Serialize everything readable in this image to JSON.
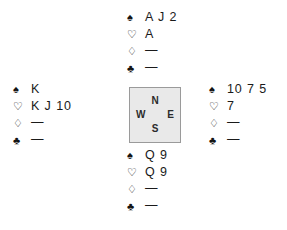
{
  "diagram": {
    "type": "bridge-hand-diagram",
    "suit_symbols": {
      "spade": "♠",
      "heart": "♡",
      "diamond": "♢",
      "club": "♣"
    },
    "void_marker": "—",
    "colors": {
      "background": "#ffffff",
      "text": "#1a1a1a",
      "compass_fill": "#e9e9e9",
      "compass_border": "#9a9a9a",
      "compass_text": "#2b2b2b"
    },
    "compass": {
      "north": "N",
      "west": "W",
      "east": "E",
      "south": "S"
    },
    "hands": {
      "north": {
        "position": "North",
        "spades": "A J 2",
        "hearts": "A",
        "diamonds": "—",
        "clubs": "—"
      },
      "west": {
        "position": "West",
        "spades": "K",
        "hearts": "K J 10",
        "diamonds": "—",
        "clubs": "—"
      },
      "east": {
        "position": "East",
        "spades": "10 7 5",
        "hearts": "7",
        "diamonds": "—",
        "clubs": "—"
      },
      "south": {
        "position": "South",
        "spades": "Q 9",
        "hearts": "Q 9",
        "diamonds": "—",
        "clubs": "—"
      }
    }
  }
}
